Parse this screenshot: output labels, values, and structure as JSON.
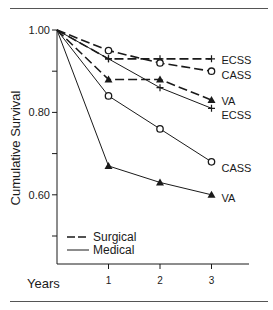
{
  "chart_data": {
    "type": "line",
    "title": "",
    "xlabel": "Years",
    "ylabel": "Cumulative Survival",
    "x": [
      0,
      1,
      2,
      3
    ],
    "xticks": [
      "1",
      "2",
      "3"
    ],
    "yticks": [
      "1.00",
      "0.80",
      "0.60"
    ],
    "ylim": [
      0.5,
      1.0
    ],
    "grid": false,
    "legend": {
      "position": "lower-left inside",
      "entries": [
        {
          "label": "Surgical",
          "style": "dashed"
        },
        {
          "label": "Medical",
          "style": "solid"
        }
      ]
    },
    "series": [
      {
        "name": "ECSS",
        "group": "Surgical",
        "style": "dashed",
        "marker": "plus",
        "values": [
          1.0,
          0.93,
          0.93,
          0.93
        ]
      },
      {
        "name": "CASS",
        "group": "Surgical",
        "style": "dashed",
        "marker": "circle",
        "values": [
          1.0,
          0.95,
          0.92,
          0.9
        ]
      },
      {
        "name": "VA",
        "group": "Surgical",
        "style": "dashed",
        "marker": "triangle",
        "values": [
          1.0,
          0.88,
          0.88,
          0.83
        ]
      },
      {
        "name": "ECSS",
        "group": "Medical",
        "style": "solid",
        "marker": "plus",
        "values": [
          1.0,
          0.93,
          0.86,
          0.81
        ]
      },
      {
        "name": "CASS",
        "group": "Medical",
        "style": "solid",
        "marker": "circle",
        "values": [
          1.0,
          0.84,
          0.76,
          0.68
        ]
      },
      {
        "name": "VA",
        "group": "Medical",
        "style": "solid",
        "marker": "triangle",
        "values": [
          1.0,
          0.67,
          0.63,
          0.6
        ]
      }
    ],
    "line_color": "#1a1a1a"
  }
}
